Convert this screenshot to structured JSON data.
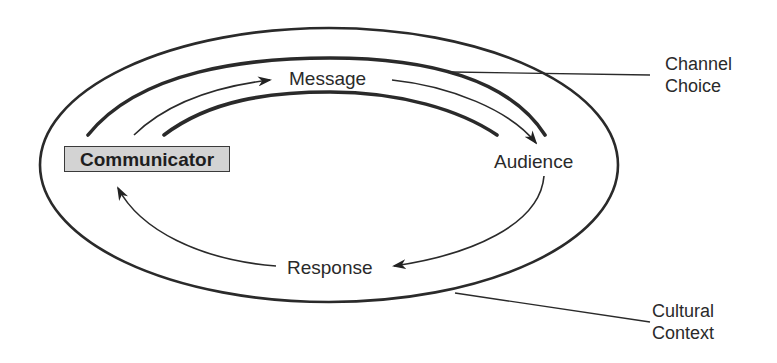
{
  "diagram": {
    "title": "",
    "nodes": {
      "communicator": "Communicator",
      "message": "Message",
      "audience": "Audience",
      "response": "Response"
    },
    "annotations": {
      "channel_choice": [
        "Channel",
        "Choice"
      ],
      "cultural_context": [
        "Cultural",
        "Context"
      ]
    },
    "flows": [
      {
        "from": "Communicator",
        "to": "Message",
        "style": "arrow"
      },
      {
        "from": "Message",
        "to": "Audience",
        "style": "arrow"
      },
      {
        "from": "Audience",
        "to": "Response",
        "style": "arrow"
      },
      {
        "from": "Response",
        "to": "Communicator",
        "style": "arrow"
      }
    ],
    "colors": {
      "line": "#2a2a2a",
      "box_fill": "#d3d3d3",
      "background": "#ffffff"
    }
  }
}
